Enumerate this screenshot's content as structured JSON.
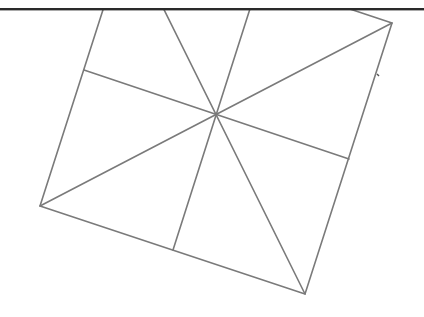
{
  "figure": {
    "colors": {
      "background": "#ffffff",
      "line": "#7a7a7a",
      "top_bar": "#2a2a2a"
    },
    "top_bar_y": 9,
    "vertices": {
      "top_left": [
        127,
        -65
      ],
      "top_right": [
        392,
        23
      ],
      "bottom_right": [
        305,
        294
      ],
      "bottom_left": [
        40,
        206
      ]
    },
    "midpoints": {
      "top": [
        259.5,
        -21
      ],
      "right": [
        349,
        159
      ],
      "bottom": [
        173,
        250
      ],
      "left": [
        84,
        70
      ]
    },
    "center": [
      215,
      116
    ],
    "tick_mark": [
      378,
      75
    ]
  }
}
